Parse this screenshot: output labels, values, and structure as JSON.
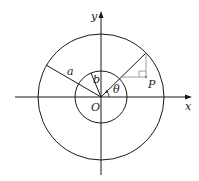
{
  "diagram": {
    "type": "polar-coordinates-annulus",
    "labels": {
      "y_axis": "y",
      "x_axis": "x",
      "origin": "O",
      "outer_radius": "a",
      "inner_radius": "b",
      "angle": "θ",
      "point": "P"
    },
    "colors": {
      "stroke": "#1a1a1a",
      "construction": "#888888",
      "background": "#ffffff"
    },
    "geometry": {
      "origin": [
        101,
        97
      ],
      "outer_circle_radius": 63,
      "inner_circle_radius": 26,
      "theta_degrees": 41
    }
  }
}
